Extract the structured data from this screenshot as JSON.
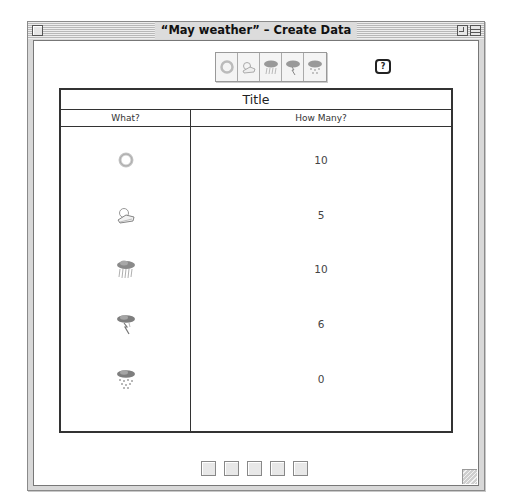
{
  "window": {
    "title": "“May weather” – Create Data"
  },
  "toolbar": {
    "tools": [
      {
        "icon": "sun-icon"
      },
      {
        "icon": "partly-cloudy-icon"
      },
      {
        "icon": "rain-icon"
      },
      {
        "icon": "thunderstorm-icon"
      },
      {
        "icon": "snow-icon"
      }
    ],
    "help_label": "?"
  },
  "table": {
    "title": "Title",
    "headers": {
      "what": "What?",
      "how_many": "How Many?"
    },
    "rows": [
      {
        "what": "sun-icon",
        "how_many": "10"
      },
      {
        "what": "partly-cloudy-icon",
        "how_many": "5"
      },
      {
        "what": "rain-icon",
        "how_many": "10"
      },
      {
        "what": "thunderstorm-icon",
        "how_many": "6"
      },
      {
        "what": "snow-icon",
        "how_many": "0"
      }
    ]
  },
  "bottom_toolbar": {
    "icons": [
      "table-view-icon",
      "picture-graph-icon",
      "bar-graph-icon",
      "pie-view-icon",
      "data-view-icon"
    ]
  }
}
